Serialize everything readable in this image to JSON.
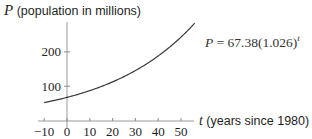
{
  "chart_data": {
    "type": "line",
    "title": "",
    "xlabel": "t (years since 1980)",
    "ylabel": "P (population in millions)",
    "xlabel_var": "t",
    "xlabel_text": " (years since 1980)",
    "ylabel_var": "P",
    "ylabel_text": " (population in millions)",
    "x_ticks": [
      -10,
      0,
      10,
      20,
      30,
      40,
      50
    ],
    "x_tick_labels": [
      "−10",
      "0",
      "10",
      "20",
      "30",
      "40",
      "50"
    ],
    "y_ticks": [
      100,
      200
    ],
    "y_tick_labels": [
      "100",
      "200"
    ],
    "xlim": [
      -10,
      56
    ],
    "ylim": [
      0,
      290
    ],
    "grid": false,
    "legend": null,
    "series": [
      {
        "name": "P = 67.38(1.026)^t",
        "formula": {
          "a": 67.38,
          "b": 1.026
        },
        "x": [
          -10,
          0,
          10,
          20,
          30,
          40,
          50,
          56
        ],
        "values": [
          52.0,
          67.38,
          87.1,
          112.6,
          145.6,
          188.3,
          243.4,
          284.0
        ]
      }
    ],
    "annotations": [
      {
        "text_var": "P",
        "text": " = 67.38(1.026)",
        "superscript": "t",
        "position": "right of curve near top"
      }
    ]
  }
}
